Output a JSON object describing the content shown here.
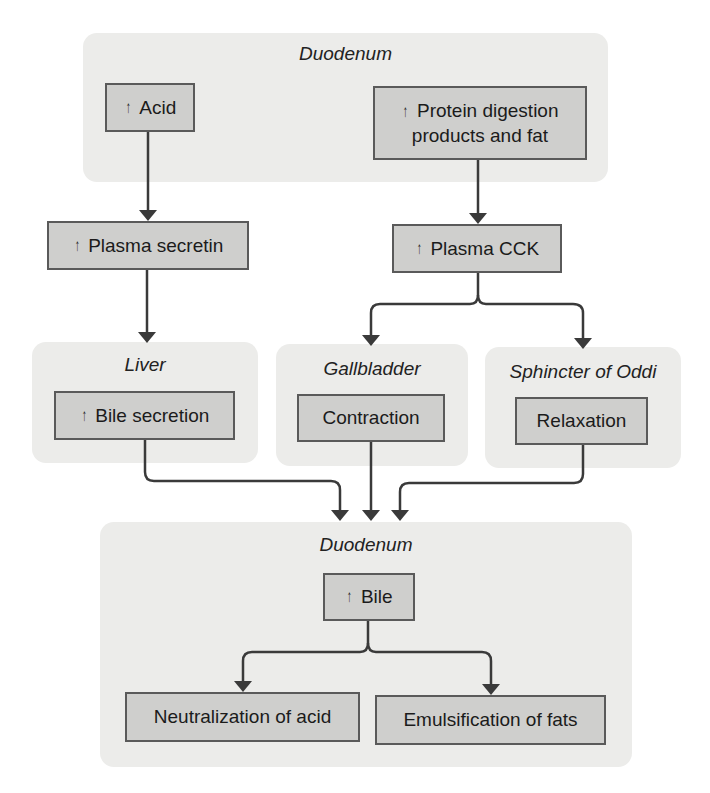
{
  "diagram": {
    "top_region": {
      "title": "Duodenum",
      "acid": {
        "arrow": "↑",
        "label": "Acid"
      },
      "protein": {
        "arrow": "↑",
        "line1": "Protein digestion",
        "line2": "products and fat"
      }
    },
    "plasma_secretin": {
      "arrow": "↑",
      "label": "Plasma secretin"
    },
    "plasma_cck": {
      "arrow": "↑",
      "label": "Plasma CCK"
    },
    "liver_region": {
      "title": "Liver",
      "box": {
        "arrow": "↑",
        "label": "Bile secretion"
      }
    },
    "gallbladder_region": {
      "title": "Gallbladder",
      "box": {
        "label": "Contraction"
      }
    },
    "sphincter_region": {
      "title": "Sphincter of Oddi",
      "box": {
        "label": "Relaxation"
      }
    },
    "bottom_region": {
      "title": "Duodenum",
      "bile": {
        "arrow": "↑",
        "label": "Bile"
      },
      "neutralization": {
        "label": "Neutralization of acid"
      },
      "emulsification": {
        "label": "Emulsification of fats"
      }
    },
    "colors": {
      "region_bg": "#ececea",
      "box_bg": "#cfcfcd",
      "box_border": "#5a5a5a",
      "connector": "#3a3a3a"
    }
  }
}
